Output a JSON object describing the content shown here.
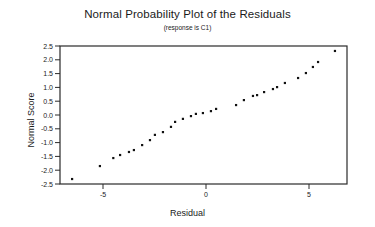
{
  "chart_data": {
    "type": "scatter",
    "title": "Normal Probability Plot of the Residuals",
    "subtitle": "(response is C1)",
    "xlabel": "Residual",
    "ylabel": "Normal Score",
    "xlim": [
      -7.1,
      6.8
    ],
    "ylim": [
      -2.5,
      2.5
    ],
    "x_ticks": [
      -5,
      0,
      5
    ],
    "x_tick_labels": [
      "-5",
      "0",
      "5"
    ],
    "y_ticks": [
      2.5,
      2.0,
      1.5,
      1.0,
      0.5,
      0.0,
      -0.5,
      -1.0,
      -1.5,
      -2.0,
      -2.5
    ],
    "y_tick_labels": [
      "2.5",
      "2.0",
      "1.5",
      "1.0",
      "0.5",
      "0.0",
      "-0.5",
      "-1.0",
      "-1.5",
      "-2.0",
      "-2.5"
    ],
    "grid": false,
    "legend": null,
    "series": [
      {
        "name": "Residuals",
        "x": [
          -6.5,
          -5.15,
          -4.5,
          -4.17,
          -3.74,
          -3.5,
          -3.1,
          -2.72,
          -2.48,
          -2.09,
          -1.7,
          -1.5,
          -1.12,
          -0.73,
          -0.49,
          -0.15,
          0.24,
          0.49,
          1.46,
          1.84,
          2.28,
          2.48,
          2.82,
          3.25,
          3.45,
          3.83,
          4.47,
          4.85,
          5.19,
          5.44,
          6.26
        ],
        "y": [
          -2.32,
          -1.85,
          -1.56,
          -1.45,
          -1.34,
          -1.27,
          -1.09,
          -0.91,
          -0.72,
          -0.62,
          -0.43,
          -0.25,
          -0.14,
          -0.04,
          0.04,
          0.07,
          0.14,
          0.22,
          0.36,
          0.54,
          0.69,
          0.72,
          0.83,
          0.94,
          1.01,
          1.16,
          1.34,
          1.52,
          1.74,
          1.92,
          2.32
        ]
      }
    ]
  },
  "colors": {
    "axis": "#2a2a2a",
    "point": "#111111",
    "background": "#ffffff"
  },
  "geometry": {
    "frame": {
      "left": 60,
      "right": 347,
      "top": 46,
      "bottom": 184
    },
    "x_zero_px": 206,
    "x_px_per_unit": 20.6,
    "y_zero_px": 115,
    "y_px_per_unit": 27.6
  }
}
